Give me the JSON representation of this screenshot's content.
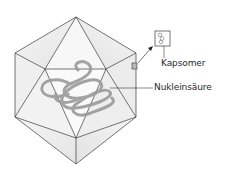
{
  "diagram": {
    "labels": {
      "capsomer": "Kapsomer",
      "nucleic_acid": "Nukleinsäure"
    },
    "colors": {
      "edge": "#3a3a3a",
      "face_light": "#f4f4f4",
      "face_shade": "#e6e6e6",
      "nucleic_acid": "#9a9a9a",
      "capsomer_fill": "#b8b8b8",
      "text": "#2a2a2a"
    }
  }
}
